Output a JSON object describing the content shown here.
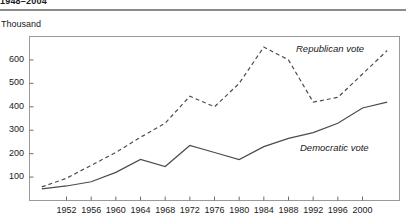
{
  "header": {
    "title": "1948–2004",
    "unit_label": "Thousand"
  },
  "chart_data": {
    "type": "line",
    "title": "1948–2004",
    "subtitle": "",
    "xlabel": "",
    "ylabel": "Thousand",
    "unit": "Thousand",
    "grid": false,
    "legend_position": "inline-annotation",
    "x": [
      1948,
      1952,
      1956,
      1960,
      1964,
      1968,
      1972,
      1976,
      1980,
      1984,
      1988,
      1992,
      1996,
      2000,
      2004
    ],
    "xlim": [
      1946,
      2006
    ],
    "ylim": [
      0,
      700
    ],
    "xticks": [
      1952,
      1956,
      1960,
      1964,
      1968,
      1972,
      1976,
      1980,
      1984,
      1988,
      1992,
      1996,
      2000
    ],
    "xticklabels": [
      "1952",
      "1956",
      "1960",
      "1964",
      "1968",
      "1972",
      "1976",
      "1980",
      "1984",
      "1988",
      "1992",
      "1996",
      "2000"
    ],
    "yticks": [
      100,
      200,
      300,
      400,
      500,
      600
    ],
    "yticklabels": [
      "100",
      "200",
      "300",
      "400",
      "500",
      "600"
    ],
    "series": [
      {
        "name": "Republican vote",
        "style": "dashed",
        "color": "#4c4c4c",
        "label_text": "Republican vote",
        "values": [
          58,
          95,
          150,
          205,
          270,
          330,
          445,
          400,
          500,
          655,
          600,
          420,
          440,
          540,
          640
        ]
      },
      {
        "name": "Democratic vote",
        "style": "solid",
        "color": "#4c4c4c",
        "label_text": "Democratic vote",
        "values": [
          50,
          62,
          80,
          120,
          175,
          145,
          235,
          205,
          175,
          230,
          265,
          290,
          330,
          395,
          420
        ]
      }
    ]
  }
}
